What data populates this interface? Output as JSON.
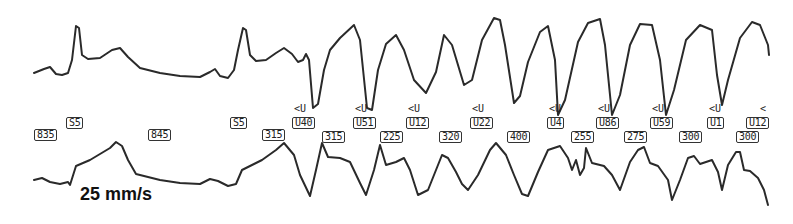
{
  "speed_label": "25 mm/s",
  "trace_color": "#2a2a2a",
  "beat_labels": [
    {
      "text": "S5",
      "x": 66,
      "y": 117
    },
    {
      "text": "835",
      "x": 34,
      "y": 129
    },
    {
      "text": "845",
      "x": 148,
      "y": 129
    },
    {
      "text": "S5",
      "x": 230,
      "y": 117
    },
    {
      "text": "315",
      "x": 262,
      "y": 129
    },
    {
      "text": "U40",
      "x": 292,
      "y": 117
    },
    {
      "text": "315",
      "x": 322,
      "y": 131
    },
    {
      "text": "U51",
      "x": 353,
      "y": 117
    },
    {
      "text": "225",
      "x": 380,
      "y": 131
    },
    {
      "text": "U12",
      "x": 406,
      "y": 117
    },
    {
      "text": "320",
      "x": 439,
      "y": 131
    },
    {
      "text": "U22",
      "x": 470,
      "y": 117
    },
    {
      "text": "400",
      "x": 507,
      "y": 131
    },
    {
      "text": "U4",
      "x": 547,
      "y": 117
    },
    {
      "text": "255",
      "x": 571,
      "y": 131
    },
    {
      "text": "U86",
      "x": 596,
      "y": 117
    },
    {
      "text": "275",
      "x": 624,
      "y": 131
    },
    {
      "text": "U59",
      "x": 650,
      "y": 117
    },
    {
      "text": "300",
      "x": 679,
      "y": 131
    },
    {
      "text": "U1",
      "x": 707,
      "y": 117
    },
    {
      "text": "U12",
      "x": 746,
      "y": 117
    },
    {
      "text": "300",
      "x": 736,
      "y": 131
    }
  ],
  "markers": [
    {
      "text": "<U",
      "x": 294,
      "y": 104
    },
    {
      "text": "<U",
      "x": 355,
      "y": 104
    },
    {
      "text": "<U",
      "x": 408,
      "y": 104
    },
    {
      "text": "<U",
      "x": 472,
      "y": 104
    },
    {
      "text": "<U",
      "x": 549,
      "y": 104
    },
    {
      "text": "<U",
      "x": 598,
      "y": 104
    },
    {
      "text": "<U",
      "x": 652,
      "y": 104
    },
    {
      "text": "<U",
      "x": 709,
      "y": 104
    },
    {
      "text": "<",
      "x": 760,
      "y": 104
    }
  ]
}
